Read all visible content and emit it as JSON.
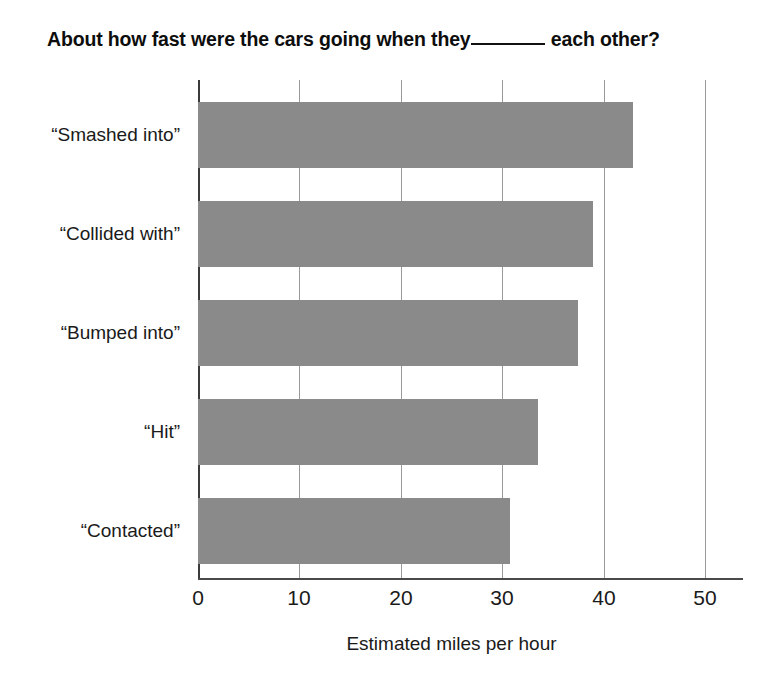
{
  "chart_data": {
    "type": "bar",
    "orientation": "horizontal",
    "title_prefix": "About how fast were the cars going when they",
    "title_suffix": "each other?",
    "title_blank": "_______",
    "xlabel": "Estimated miles per hour",
    "ylabel": "",
    "categories": [
      "“Smashed into”",
      "“Collided with”",
      "“Bumped into”",
      "“Hit”",
      "“Contacted”"
    ],
    "values": [
      42.9,
      39.0,
      37.5,
      33.5,
      30.8
    ],
    "xlim": [
      0,
      50
    ],
    "xticks": [
      0,
      10,
      20,
      30,
      40,
      50
    ],
    "xtick_labels": [
      "0",
      "10",
      "20",
      "30",
      "40",
      "50"
    ],
    "grid": "vertical",
    "legend": "none",
    "bar_color": "#8a8a8a",
    "axis_color": "#3a3a3a",
    "gridline_color": "#9a9a9a",
    "text_color": "#1a1a1a"
  }
}
